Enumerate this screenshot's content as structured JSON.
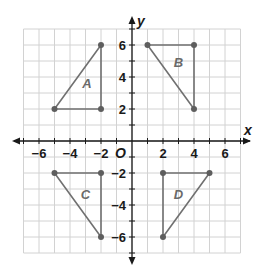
{
  "diagram": {
    "type": "coordinate_plane",
    "axes": {
      "x_label": "x",
      "y_label": "y",
      "origin_label": "O",
      "x_tick_labels": [
        "−6",
        "−4",
        "−2",
        "2",
        "4",
        "6"
      ],
      "x_tick_values": [
        -6,
        -4,
        -2,
        2,
        4,
        6
      ],
      "y_tick_labels": [
        "6",
        "4",
        "2",
        "−2",
        "−4",
        "−6"
      ],
      "y_tick_values": [
        6,
        4,
        2,
        -2,
        -4,
        -6
      ],
      "range": {
        "x": [
          -7,
          7
        ],
        "y": [
          -7,
          7
        ]
      }
    },
    "colors": {
      "grid": "#d2d2d2",
      "axis": "#1a1a1a",
      "shape_edge": "#707070",
      "vertex": "#5e5e5e",
      "shape_label": "#6a6a6a"
    },
    "shapes": [
      {
        "name": "A",
        "label": "A",
        "vertices": [
          [
            -5,
            2
          ],
          [
            -2,
            2
          ],
          [
            -2,
            6
          ]
        ],
        "label_at": [
          -2.9,
          3.3
        ]
      },
      {
        "name": "B",
        "label": "B",
        "vertices": [
          [
            1,
            6
          ],
          [
            4,
            6
          ],
          [
            4,
            2
          ]
        ],
        "label_at": [
          3.0,
          4.6
        ]
      },
      {
        "name": "C",
        "label": "C",
        "vertices": [
          [
            -5,
            -2
          ],
          [
            -2,
            -2
          ],
          [
            -2,
            -6
          ]
        ],
        "label_at": [
          -3.0,
          -3.6
        ]
      },
      {
        "name": "D",
        "label": "D",
        "vertices": [
          [
            2,
            -2
          ],
          [
            5,
            -2
          ],
          [
            2,
            -6
          ]
        ],
        "label_at": [
          3.0,
          -3.6
        ]
      }
    ]
  }
}
